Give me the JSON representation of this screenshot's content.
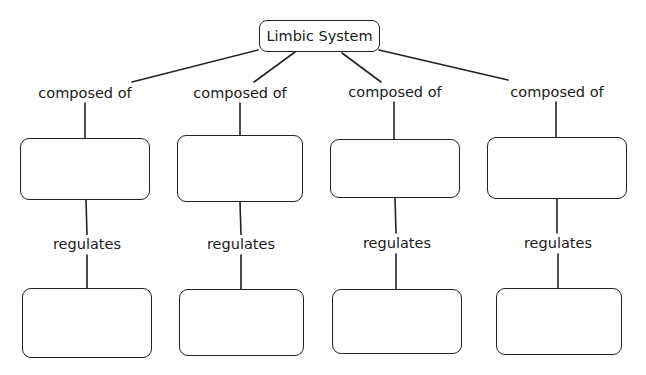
{
  "diagram": {
    "type": "concept-map",
    "root": {
      "label": "Limbic System"
    },
    "branches": [
      {
        "link_label": "composed of",
        "component": {
          "label": ""
        },
        "sub_link_label": "regulates",
        "function": {
          "label": ""
        }
      },
      {
        "link_label": "composed of",
        "component": {
          "label": ""
        },
        "sub_link_label": "regulates",
        "function": {
          "label": ""
        }
      },
      {
        "link_label": "composed of",
        "component": {
          "label": ""
        },
        "sub_link_label": "regulates",
        "function": {
          "label": ""
        }
      },
      {
        "link_label": "composed of",
        "component": {
          "label": ""
        },
        "sub_link_label": "regulates",
        "function": {
          "label": ""
        }
      }
    ]
  },
  "colors": {
    "line": "#222222",
    "text": "#1a1a1a",
    "background": "#ffffff"
  }
}
